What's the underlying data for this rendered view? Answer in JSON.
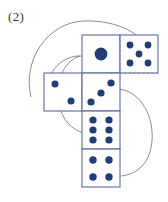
{
  "figure": {
    "label": "(2)",
    "caption_label": "(2)",
    "colors": {
      "pip": "#1F3C7B",
      "square_border": "#5B6B9E",
      "fold_line": "#7D8CB5",
      "curve": "#6E6E78",
      "label_text": "#3a3a3a",
      "background": "#ffffff"
    },
    "geometry": {
      "square_size": 38,
      "center_column_x": 82,
      "top_y": 35
    },
    "squares": [
      {
        "name": "face-one",
        "face_value": 1,
        "x": 82,
        "y": 35,
        "pip_layout": "center-large",
        "pip_radius": 6.2
      },
      {
        "name": "face-five",
        "face_value": 5,
        "x": 120,
        "y": 35,
        "pip_layout": "quincunx",
        "pip_radius": 3.4
      },
      {
        "name": "face-two",
        "face_value": 2,
        "x": 44,
        "y": 73,
        "pip_layout": "diagonal",
        "pip_radius": 3.4
      },
      {
        "name": "face-three",
        "face_value": 3,
        "x": 82,
        "y": 73,
        "pip_layout": "diagonal",
        "pip_radius": 3.6
      },
      {
        "name": "face-six",
        "face_value": 6,
        "x": 82,
        "y": 111,
        "pip_layout": "two-columns-of-three",
        "pip_radius": 3.5
      },
      {
        "name": "face-four",
        "face_value": 4,
        "x": 82,
        "y": 149,
        "pip_layout": "corners",
        "pip_radius": 3.6
      }
    ],
    "pips": {
      "face-one": [
        [
          19,
          19
        ]
      ],
      "face-five": [
        [
          10,
          10
        ],
        [
          28,
          10
        ],
        [
          19,
          19
        ],
        [
          10,
          28
        ],
        [
          28,
          28
        ]
      ],
      "face-two": [
        [
          11,
          11
        ],
        [
          27,
          28
        ]
      ],
      "face-three": [
        [
          9,
          29
        ],
        [
          19,
          20
        ],
        [
          29,
          10
        ]
      ],
      "face-six": [
        [
          11,
          9
        ],
        [
          27,
          9
        ],
        [
          11,
          19
        ],
        [
          27,
          19
        ],
        [
          11,
          29
        ],
        [
          27,
          29
        ]
      ],
      "face-four": [
        [
          11,
          11
        ],
        [
          27,
          11
        ],
        [
          11,
          28
        ],
        [
          27,
          28
        ]
      ]
    },
    "fold_lines": [
      {
        "name": "fold-one-five",
        "x1": 120,
        "y1": 35,
        "x2": 120,
        "y2": 73
      },
      {
        "name": "fold-one-three",
        "x1": 82,
        "y1": 73,
        "x2": 158,
        "y2": 73
      },
      {
        "name": "fold-two-three",
        "x1": 82,
        "y1": 73,
        "x2": 82,
        "y2": 111
      },
      {
        "name": "fold-three-six",
        "x1": 82,
        "y1": 111,
        "x2": 120,
        "y2": 111
      },
      {
        "name": "fold-six-four",
        "x1": 82,
        "y1": 149,
        "x2": 120,
        "y2": 149
      }
    ],
    "curves": [
      {
        "name": "curve-outer-top",
        "d": "M 31 97 C 22 60 48 22 84 21 C 118 20 140 34 146 46"
      },
      {
        "name": "curve-inner-left",
        "d": "M 47 100 C 44 74 60 57 78 56 C 94 55 104 64 108 74"
      },
      {
        "name": "curve-mid-left",
        "d": "M 80 56 C 62 62 55 84 59 104 C 62 120 72 130 84 133"
      },
      {
        "name": "curve-right-bulge",
        "d": "M 119 89 C 142 92 154 118 152 141 C 150 163 138 174 121 176"
      }
    ]
  }
}
